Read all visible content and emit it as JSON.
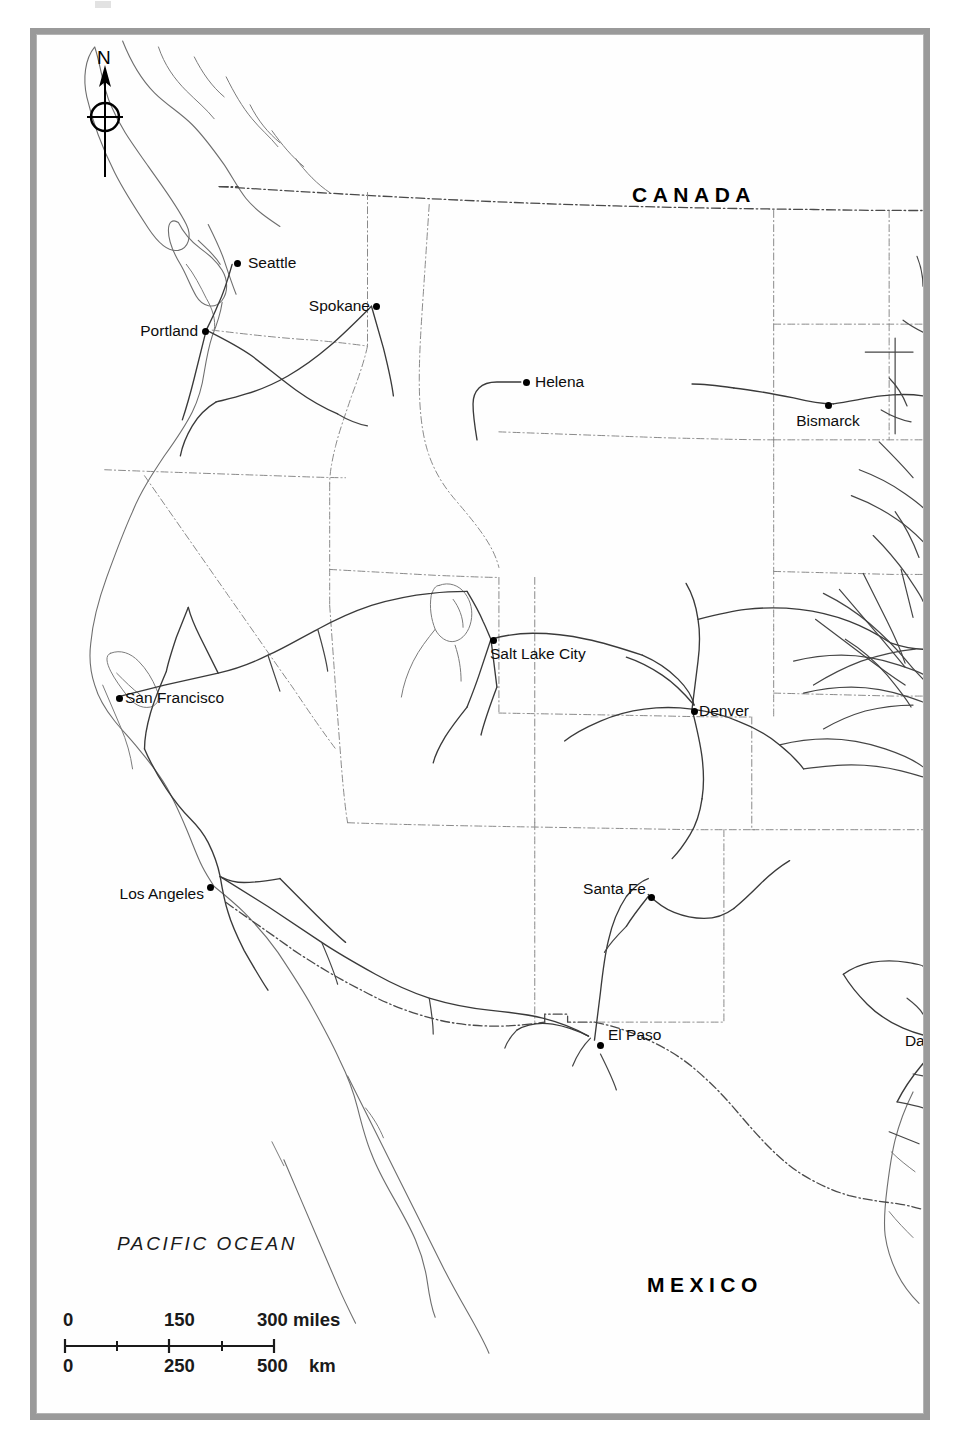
{
  "map": {
    "title_region": "Western United States railroad map",
    "background_color": "#ffffff",
    "frame_color": "#9a9a9a",
    "line_color": "#333333",
    "border_color": "#555555"
  },
  "compass": {
    "north_label": "N",
    "icon": "compass-rose-north-arrow"
  },
  "country_labels": [
    {
      "name": "canada",
      "text": "CANADA",
      "x": 595,
      "y": 148
    },
    {
      "name": "mexico",
      "text": "MEXICO",
      "x": 610,
      "y": 1238
    }
  ],
  "ocean_labels": [
    {
      "name": "pacific-ocean",
      "text": "PACIFIC OCEAN",
      "x": 80,
      "y": 1198
    }
  ],
  "cities": [
    {
      "name": "seattle",
      "label": "Seattle",
      "dot_x": 200,
      "dot_y": 228,
      "label_x": 211,
      "label_y": 228,
      "anchor": "left"
    },
    {
      "name": "portland",
      "label": "Portland",
      "dot_x": 168,
      "dot_y": 296,
      "label_x": 161,
      "label_y": 296,
      "anchor": "right"
    },
    {
      "name": "spokane",
      "label": "Spokane",
      "dot_x": 339,
      "dot_y": 271,
      "label_x": 333,
      "label_y": 271,
      "anchor": "right"
    },
    {
      "name": "helena",
      "label": "Helena",
      "dot_x": 489,
      "dot_y": 347,
      "label_x": 498,
      "label_y": 347,
      "anchor": "left"
    },
    {
      "name": "bismarck",
      "label": "Bismarck",
      "dot_x": 791,
      "dot_y": 370,
      "label_x": 791,
      "label_y": 386,
      "anchor": "center"
    },
    {
      "name": "salt-lake-city",
      "label": "Salt Lake City",
      "dot_x": 456,
      "dot_y": 605,
      "label_x": 453,
      "label_y": 619,
      "anchor": "left"
    },
    {
      "name": "denver",
      "label": "Denver",
      "dot_x": 657,
      "dot_y": 676,
      "label_x": 662,
      "label_y": 676,
      "anchor": "left"
    },
    {
      "name": "san-francisco",
      "label": "San Francisco",
      "dot_x": 82,
      "dot_y": 663,
      "label_x": 88,
      "label_y": 663,
      "anchor": "left"
    },
    {
      "name": "los-angeles",
      "label": "Los Angeles",
      "dot_x": 173,
      "dot_y": 852,
      "label_x": 167,
      "label_y": 859,
      "anchor": "right"
    },
    {
      "name": "santa-fe",
      "label": "Santa Fe",
      "dot_x": 614,
      "dot_y": 862,
      "label_x": 609,
      "label_y": 854,
      "anchor": "right"
    },
    {
      "name": "el-paso",
      "label": "El Paso",
      "dot_x": 563,
      "dot_y": 1010,
      "label_x": 571,
      "label_y": 1000,
      "anchor": "left"
    },
    {
      "name": "dallas",
      "label": "Dallas",
      "dot_x": 918,
      "dot_y": 1008,
      "label_x": 911,
      "label_y": 1006,
      "anchor": "right"
    }
  ],
  "scale_bar": {
    "miles": {
      "ticks": [
        "0",
        "150",
        "300"
      ],
      "unit": "miles",
      "max": 300
    },
    "km": {
      "ticks": [
        "0",
        "250",
        "500"
      ],
      "unit": "km",
      "max": 500
    }
  }
}
